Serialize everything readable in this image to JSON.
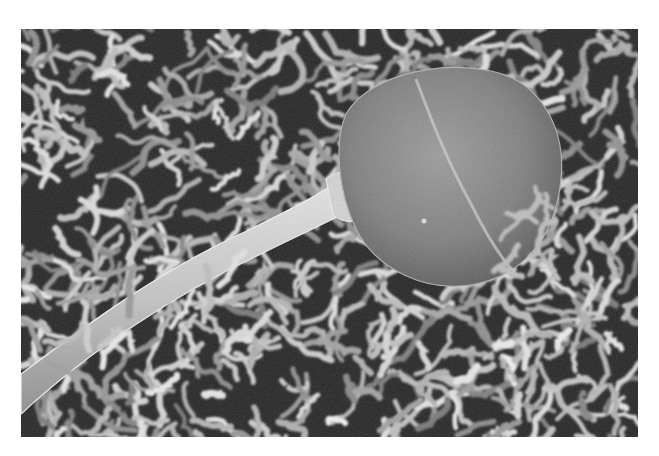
{
  "image": {
    "kind": "scanning electron micrograph",
    "subject": "sperm cell on egg surface covered with microvilli",
    "alt": "Grayscale scanning electron micrograph of a sperm cell head and tail resting on a dense field of microvilli",
    "colors": {
      "background": "#ffffff",
      "dark_tone": "#1e1e1e",
      "mid_tone": "#6e6e6e",
      "light_tone": "#d8d8d8",
      "head_tone": "#8a8a8a",
      "tail_tone": "#c8c8c8"
    }
  }
}
